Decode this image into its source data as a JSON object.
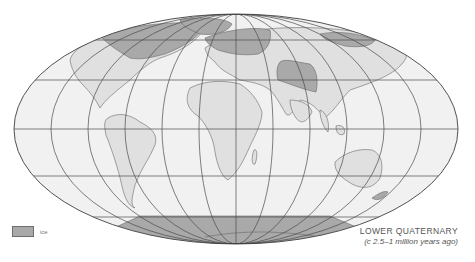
{
  "map": {
    "projection": "mollweide-like world map",
    "colors": {
      "background": "#ffffff",
      "land": "#e2e2e2",
      "ocean": "#f0f0f0",
      "ice": "#a9a9a9",
      "lines": "#4a4a4a"
    }
  },
  "legend": {
    "label": "ice",
    "color": "#a9a9a9"
  },
  "title": {
    "line1": "LOWER QUATERNARY",
    "line2": "(c 2.5–1 million years ago)"
  }
}
